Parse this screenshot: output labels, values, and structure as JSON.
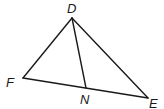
{
  "diagram": {
    "type": "triangle",
    "vertices": {
      "D": {
        "label": "D",
        "x": 72,
        "y": 18
      },
      "F": {
        "label": "F",
        "x": 23,
        "y": 78
      },
      "E": {
        "label": "E",
        "x": 148,
        "y": 98
      },
      "N": {
        "label": "N",
        "x": 86,
        "y": 88
      }
    },
    "segments": [
      {
        "from": "D",
        "to": "F"
      },
      {
        "from": "D",
        "to": "E"
      },
      {
        "from": "F",
        "to": "E"
      },
      {
        "from": "D",
        "to": "N"
      }
    ],
    "labels": {
      "D": "D",
      "F": "F",
      "N": "N",
      "E": "E"
    },
    "colors": {
      "line": "#1a1a1a",
      "background": "#ffffff"
    }
  }
}
